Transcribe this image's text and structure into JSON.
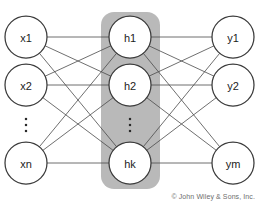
{
  "diagram": {
    "background_color": "#ffffff",
    "hidden_panel_color": "#b9b9b9",
    "node_fill_color": "#ffffff",
    "node_stroke_color": "#3a3a3a",
    "edge_color": "#4a4a4a",
    "layers": [
      {
        "id": "input",
        "name": "input-layer",
        "cx": 26,
        "nodes": [
          {
            "id": "x1",
            "label": "x1",
            "cx": 26,
            "cy": 37,
            "r": 21
          },
          {
            "id": "x2",
            "label": "x2",
            "cx": 26,
            "cy": 85,
            "r": 21
          },
          {
            "id": "xn",
            "label": "xn",
            "cx": 26,
            "cy": 163,
            "r": 21
          }
        ],
        "ellipsis": {
          "cx": 26,
          "cy": 125,
          "label": "vertical-ellipsis"
        }
      },
      {
        "id": "hidden",
        "name": "hidden-layer",
        "cx": 130,
        "panel": {
          "x": 101,
          "y": 12,
          "width": 59,
          "height": 177,
          "rx": 13
        },
        "nodes": [
          {
            "id": "h1",
            "label": "h1",
            "cx": 130,
            "cy": 37,
            "r": 21
          },
          {
            "id": "h2",
            "label": "h2",
            "cx": 130,
            "cy": 85,
            "r": 21
          },
          {
            "id": "hk",
            "label": "hk",
            "cx": 130,
            "cy": 163,
            "r": 21
          }
        ],
        "ellipsis": {
          "cx": 130,
          "cy": 125,
          "label": "vertical-ellipsis"
        }
      },
      {
        "id": "output",
        "name": "output-layer",
        "cx": 233,
        "nodes": [
          {
            "id": "y1",
            "label": "y1",
            "cx": 233,
            "cy": 37,
            "r": 21
          },
          {
            "id": "y2",
            "label": "y2",
            "cx": 233,
            "cy": 85,
            "r": 21
          },
          {
            "id": "ym",
            "label": "ym",
            "cx": 233,
            "cy": 163,
            "r": 21
          }
        ]
      }
    ],
    "edges": [
      {
        "from": "x1",
        "to": "h1"
      },
      {
        "from": "x1",
        "to": "h2"
      },
      {
        "from": "x1",
        "to": "hk"
      },
      {
        "from": "x2",
        "to": "h1"
      },
      {
        "from": "x2",
        "to": "h2"
      },
      {
        "from": "x2",
        "to": "hk"
      },
      {
        "from": "xn",
        "to": "h1"
      },
      {
        "from": "xn",
        "to": "h2"
      },
      {
        "from": "xn",
        "to": "hk"
      },
      {
        "from": "h1",
        "to": "y1"
      },
      {
        "from": "h1",
        "to": "y2"
      },
      {
        "from": "h1",
        "to": "ym"
      },
      {
        "from": "h2",
        "to": "y1"
      },
      {
        "from": "h2",
        "to": "y2"
      },
      {
        "from": "h2",
        "to": "ym"
      },
      {
        "from": "hk",
        "to": "y1"
      },
      {
        "from": "hk",
        "to": "y2"
      },
      {
        "from": "hk",
        "to": "ym"
      }
    ]
  },
  "footer": {
    "copyright": "© John Wiley & Sons, Inc."
  }
}
